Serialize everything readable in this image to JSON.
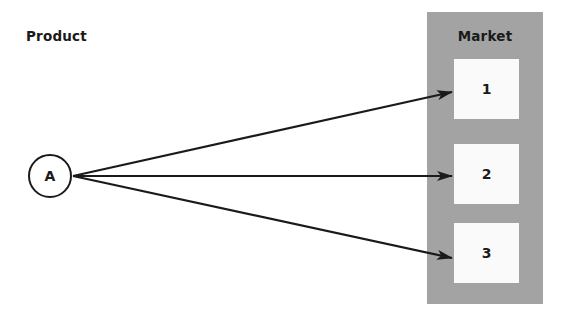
{
  "diagram": {
    "product_label": "Product",
    "market_label": "Market",
    "product_node": "A",
    "markets": [
      "1",
      "2",
      "3"
    ],
    "edges": [
      {
        "from": "A",
        "to": "1"
      },
      {
        "from": "A",
        "to": "2"
      },
      {
        "from": "A",
        "to": "3"
      }
    ],
    "colors": {
      "panel": "#a3a3a3",
      "box": "#fafafa",
      "ink": "#1a1a1a"
    }
  }
}
